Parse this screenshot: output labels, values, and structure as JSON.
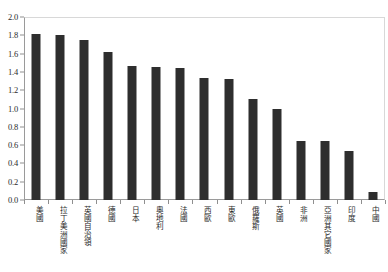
{
  "chart_data": {
    "type": "bar",
    "title": "",
    "subtitle": "",
    "xlabel": "",
    "ylabel": "",
    "ylim": [
      0.0,
      2.0
    ],
    "ytick_step": 0.2,
    "ytick_labels": [
      "2.0",
      "1.8",
      "1.6",
      "1.4",
      "1.2",
      "1.0",
      "0.8",
      "0.6",
      "0.4",
      "0.2",
      "0.0"
    ],
    "ytick_values": [
      2.0,
      1.8,
      1.6,
      1.4,
      1.2,
      1.0,
      0.8,
      0.6,
      0.4,
      0.2,
      0.0
    ],
    "grid": false,
    "legend": null,
    "bar_color": "#2e2e2e",
    "background_color": "#ffffff",
    "axis_color": "#8f8f8f",
    "categories": [
      "美國",
      "拉丁美洲國家",
      "英國自治領",
      "德國",
      "日本",
      "奧地利",
      "法國",
      "西歐",
      "東歐",
      "俄羅斯",
      "英國",
      "非洲",
      "亞洲其它國家",
      "印度",
      "中國"
    ],
    "values": [
      1.81,
      1.8,
      1.75,
      1.62,
      1.47,
      1.45,
      1.44,
      1.33,
      1.32,
      1.1,
      1.0,
      0.65,
      0.64,
      0.54,
      0.09
    ]
  }
}
